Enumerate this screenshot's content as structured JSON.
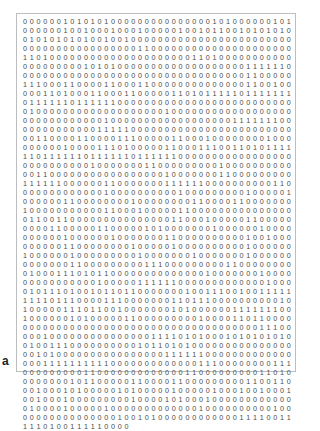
{
  "panel_label": "a",
  "rows": [
    "0000001010101000000000000000101000000101 0",
    "0000001001000100010000010010110010101010 1",
    "0101010101001001000000000000000000000000 0",
    "0000000000000000011000000000000000000000 0",
    "1101000000000000000000000110100000000000 0",
    "0000000001010100000000000000000001111110",
    "0000000000000000000000000000000001100000",
    "1110001100001100011000000000000001100100",
    "0001101000110001100000110101111101111111",
    "0111111011111100000000000000000000000000",
    "0100000000000000000001000000000000000000",
    "0000000000001000000000000000000111111100",
    "0000000000011111000000000000000000000000",
    "0011000011000011100000110001000000001000",
    "0000001000011101000001100011100110101111",
    "1101111110111111011111100000000000000000",
    "0000000000100000001100000000010000000000",
    "0011000000000000000001000000011000000000",
    "1111110000001100000001111110000000000110",
    "0000000000001000000000010000000001000001",
    "0000001100000000100000000110000110000000",
    "1000000000001100010000011000000000000000",
    "0110011000000000000000110001000001100000",
    "0000110000011000001010000000100000010000",
    "0000001000000100000001100000000001001000",
    "0000001100000000100000100000000001000000",
    "1000000100000000010000000100000001000000",
    "0000000110000000001110000000001100000000",
    "0100011101011000000000000001000000010000",
    "0000000000010000011111100000000000001000",
    "0101110100101101100000001001110010011111",
    "1111011100001110000000110111000000000010",
    "1000001110110010000000101000000111111100",
    "1000000101000001100000000010000110110000",
    "0000000000000000000000000000000000011100",
    "0001000000000000000111101010001010101010",
    "0100111000000000010110101000000000000000",
    "0010100000000000000001111110000000000000",
    "0001111111111000000000000011100000000111",
    "0000000001100000000000001100000000011010",
    "0000000101100000110000110000000001100110",
    "0010001010000010100000100000100010010001",
    "0010001000000000100001010001000000000000",
    "0100001000001000000000000010000000000100",
    "0000000000000010010100000000000011110011",
    "1110100111110000"
  ]
}
